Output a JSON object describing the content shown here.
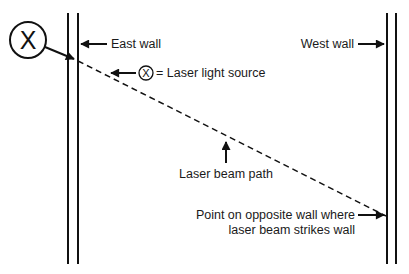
{
  "diagram": {
    "labels": {
      "east_wall": "East wall",
      "west_wall": "West wall",
      "legend_equals": "= Laser light source",
      "beam_path": "Laser beam path",
      "strike_point_line1": "Point on opposite wall where",
      "strike_point_line2": "laser beam strikes wall"
    },
    "symbols": {
      "laser_source_glyph": "X",
      "legend_glyph": "X"
    },
    "icons": {
      "source_marker": "circled-x-icon",
      "arrow": "arrow-icon"
    },
    "colors": {
      "ink": "#111111",
      "background": "#ffffff"
    }
  }
}
